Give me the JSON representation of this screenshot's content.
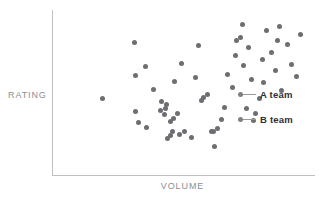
{
  "chart_data": {
    "type": "scatter",
    "title": "",
    "subtitle": "",
    "xlabel": "VOLUME",
    "ylabel": "RATING",
    "xlim": [
      0,
      100
    ],
    "ylim": [
      0,
      100
    ],
    "grid": false,
    "axis_ticks": [],
    "legend_position": "inside-right",
    "point_color": "#6d6e72",
    "axis_color": "#bfc0c2",
    "label_color": "#8d8d92",
    "legend_text_color": "#2f2f33",
    "series": [
      {
        "name": "A team",
        "marker": "circle",
        "color": "#6d6e72",
        "points": [
          [
            30.7,
            81.2
          ],
          [
            18.3,
            46.1
          ],
          [
            31.2,
            60.3
          ],
          [
            35.5,
            27.9
          ],
          [
            31.0,
            37.9
          ],
          [
            32.3,
            31.2
          ],
          [
            38.0,
            51.5
          ],
          [
            35.1,
            66.1
          ],
          [
            41.4,
            44.2
          ],
          [
            43.0,
            42.4
          ],
          [
            42.2,
            36.1
          ],
          [
            45.6,
            25.5
          ],
          [
            49.0,
            67.9
          ],
          [
            46.2,
            56.4
          ],
          [
            47.5,
            36.4
          ],
          [
            52.8,
            21.8
          ],
          [
            55.5,
            78.8
          ],
          [
            54.6,
            58.8
          ],
          [
            57.0,
            44.8
          ],
          [
            60.6,
            25.2
          ],
          [
            62.0,
            15.8
          ],
          [
            64.8,
            33.0
          ],
          [
            66.8,
            61.2
          ],
          [
            70.2,
            72.7
          ],
          [
            73.1,
            66.7
          ],
          [
            74.4,
            39.4
          ],
          [
            77.3,
            32.4
          ],
          [
            79.5,
            45.8
          ],
          [
            80.8,
            70.3
          ],
          [
            82.4,
            88.5
          ]
        ]
      },
      {
        "name": "B team",
        "marker": "circle",
        "color": "#6d6e72",
        "points": [
          [
            41.0,
            38.2
          ],
          [
            42.6,
            40.0
          ],
          [
            44.6,
            31.5
          ],
          [
            46.0,
            33.3
          ],
          [
            43.4,
            21.0
          ],
          [
            44.9,
            22.8
          ],
          [
            48.4,
            23.5
          ],
          [
            50.0,
            25.3
          ],
          [
            57.6,
            46.6
          ],
          [
            59.2,
            48.4
          ],
          [
            61.5,
            25.1
          ],
          [
            63.1,
            26.9
          ],
          [
            66.0,
            40.6
          ],
          [
            68.9,
            53.0
          ],
          [
            70.4,
            82.4
          ],
          [
            72.0,
            84.2
          ],
          [
            75.0,
            77.6
          ],
          [
            76.5,
            57.6
          ],
          [
            78.0,
            36.4
          ],
          [
            81.0,
            55.8
          ],
          [
            84.0,
            74.5
          ],
          [
            85.6,
            63.6
          ],
          [
            87.2,
            90.9
          ],
          [
            88.0,
            50.9
          ],
          [
            90.4,
            79.4
          ],
          [
            92.0,
            67.3
          ],
          [
            94.0,
            59.4
          ],
          [
            95.6,
            86.1
          ],
          [
            72.8,
            92.1
          ],
          [
            86.4,
            82.4
          ]
        ]
      }
    ]
  },
  "legend": {
    "entries": [
      {
        "label": "A team",
        "icon": "legend-dot-icon"
      },
      {
        "label": "B team",
        "icon": "legend-dot-icon"
      }
    ]
  }
}
